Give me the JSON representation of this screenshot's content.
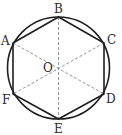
{
  "diagram": {
    "type": "geometry",
    "colors": {
      "stroke": "#1f1f1f",
      "dashed": "#8a8a8a",
      "background": "#ffffff",
      "label": "#2a2a2a"
    },
    "circle": {
      "cx": 58.5,
      "cy": 68,
      "r": 51
    },
    "center": {
      "name": "O",
      "x": 58.5,
      "y": 68
    },
    "vertices": [
      {
        "name": "A",
        "x": 13,
        "y": 43
      },
      {
        "name": "B",
        "x": 58.5,
        "y": 17
      },
      {
        "name": "C",
        "x": 104,
        "y": 43
      },
      {
        "name": "D",
        "x": 104,
        "y": 94
      },
      {
        "name": "E",
        "x": 58.5,
        "y": 119
      },
      {
        "name": "F",
        "x": 13,
        "y": 94
      }
    ],
    "dashed_segments": [
      "AD",
      "BE",
      "CF"
    ],
    "labels": {
      "A": "A",
      "B": "B",
      "C": "C",
      "D": "D",
      "E": "E",
      "F": "F",
      "O": "O"
    }
  }
}
